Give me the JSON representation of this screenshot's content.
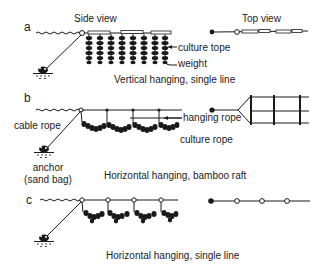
{
  "headers": {
    "side_view": "Side view",
    "top_view": "Top view"
  },
  "panels": [
    {
      "letter": "a",
      "caption": "Vertical hanging, single line",
      "labels": {
        "culture_rope": "culture tope",
        "weight": "weight"
      }
    },
    {
      "letter": "b",
      "caption": "Horizontal hanging, bamboo raft",
      "labels": {
        "cable_rope": "cable rope",
        "hanging_rope": "hanging rope",
        "culture_rope": "culture rope",
        "anchor_line1": "anchor",
        "anchor_line2": "(sand bag)"
      }
    },
    {
      "letter": "c",
      "caption": "Horizontal hanging, single line",
      "labels": {}
    }
  ],
  "colors": {
    "ink": "#1a1a1a",
    "background": "#ffffff"
  }
}
